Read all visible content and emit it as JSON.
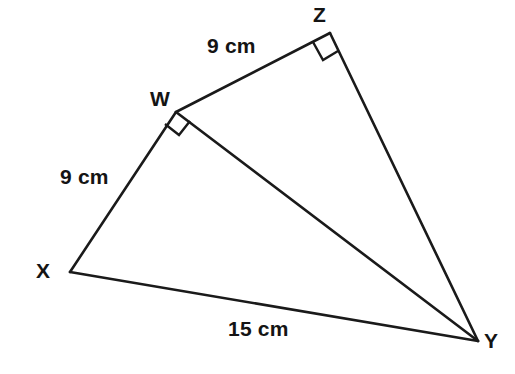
{
  "figure": {
    "background_color": "#ffffff",
    "stroke_color": "#1a1a1a"
  },
  "vertices": [
    {
      "id": "W",
      "label": "W",
      "x": 176,
      "y": 112
    },
    {
      "id": "X",
      "label": "X",
      "x": 70,
      "y": 272
    },
    {
      "id": "Y",
      "label": "Y",
      "x": 478,
      "y": 341
    },
    {
      "id": "Z",
      "label": "Z",
      "x": 330,
      "y": 33
    }
  ],
  "segments": [
    {
      "id": "XW",
      "from": "X",
      "to": "W"
    },
    {
      "id": "WZ",
      "from": "W",
      "to": "Z"
    },
    {
      "id": "ZY",
      "from": "Z",
      "to": "Y"
    },
    {
      "id": "XY",
      "from": "X",
      "to": "Y"
    },
    {
      "id": "WY",
      "from": "W",
      "to": "Y"
    }
  ],
  "side_labels": [
    {
      "id": "wz",
      "text": "9 cm",
      "segment": "WZ"
    },
    {
      "id": "xw",
      "text": "9 cm",
      "segment": "XW"
    },
    {
      "id": "xy",
      "text": "15 cm",
      "segment": "XY"
    }
  ],
  "right_angles": [
    {
      "id": "at-W",
      "vertex": "W",
      "between": [
        "WX",
        "WY"
      ]
    },
    {
      "id": "at-Z",
      "vertex": "Z",
      "between": [
        "ZW",
        "ZY"
      ]
    }
  ]
}
